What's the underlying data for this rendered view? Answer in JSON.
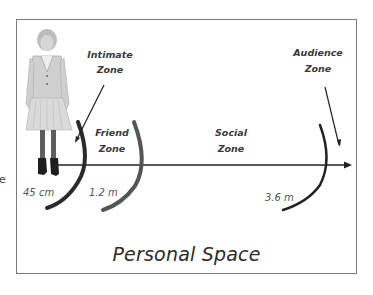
{
  "diagram": {
    "title": "Personal Space",
    "edge_fragment": "e",
    "zones": [
      {
        "name_line1": "Intimate",
        "name_line2": "Zone",
        "distance": "45 cm"
      },
      {
        "name_line1": "Friend",
        "name_line2": "Zone",
        "distance": "1.2 m"
      },
      {
        "name_line1": "Social",
        "name_line2": "Zone",
        "distance": "3.6 m"
      },
      {
        "name_line1": "Audience",
        "name_line2": "Zone",
        "distance": ""
      }
    ],
    "figure": "woman-standing",
    "colors": {
      "arc": "#2b2b2b",
      "arc_mid": "#555555",
      "axis": "#222222",
      "frame": "#7a7a7a"
    }
  }
}
